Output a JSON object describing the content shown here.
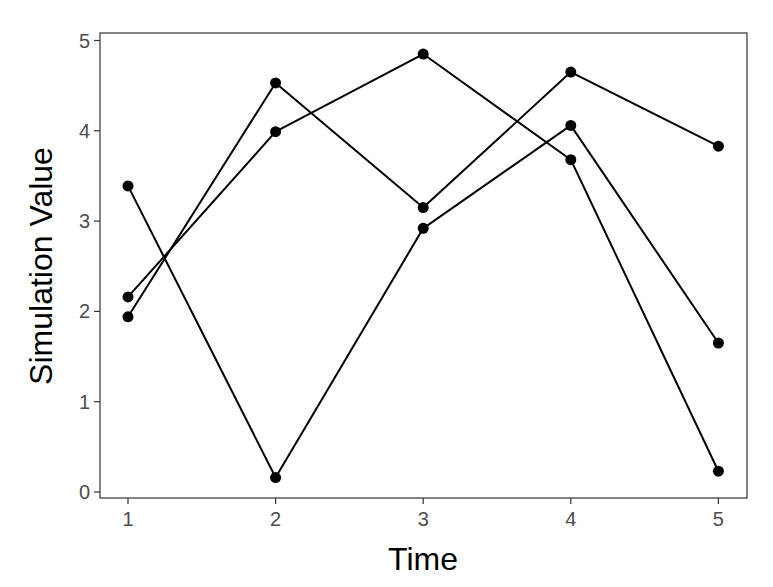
{
  "chart_data": {
    "type": "line",
    "title": "",
    "xlabel": "Time",
    "ylabel": "Simulation Value",
    "x": [
      1,
      2,
      3,
      4,
      5
    ],
    "xlim": [
      0.85,
      5.2
    ],
    "ylim": [
      0,
      5
    ],
    "xticks": [
      "1",
      "2",
      "3",
      "4",
      "5"
    ],
    "yticks": [
      "0",
      "1",
      "2",
      "3",
      "4",
      "5"
    ],
    "grid": false,
    "legend": null,
    "series": [
      {
        "name": "Simulation 1",
        "values": [
          3.39,
          0.16,
          2.92,
          4.06,
          1.65
        ]
      },
      {
        "name": "Simulation 2",
        "values": [
          2.16,
          3.99,
          4.85,
          3.68,
          0.23
        ]
      },
      {
        "name": "Simulation 3",
        "values": [
          1.94,
          4.53,
          3.15,
          4.65,
          3.83
        ]
      }
    ],
    "colors": {
      "line": "#000000",
      "point": "#000000",
      "panel_border": "#333333",
      "tick_label": "#4d4d4d"
    }
  }
}
